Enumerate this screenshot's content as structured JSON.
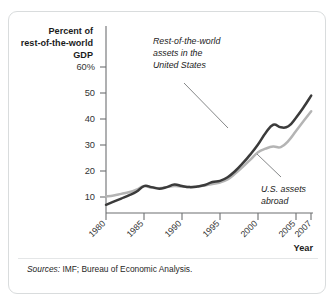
{
  "figure": {
    "y_axis_title": "Percent of\nrest-of-the-world\nGDP",
    "y_axis_title_lines": [
      "Percent of",
      "rest-of-the-world",
      "GDP"
    ],
    "x_axis_title": "Year",
    "source_label": "Sources:",
    "source_text": "IMF; Bureau of Economic Analysis.",
    "annotation_1_lines": [
      "Rest-of-the-world",
      "assets in the",
      "United States"
    ],
    "annotation_2_lines": [
      "U.S. assets",
      "abroad"
    ],
    "colors": {
      "series_dark": "#3b3b3b",
      "series_light": "#b4b4b4",
      "axis": "#6d6f71",
      "text": "#1b1b1b",
      "border": "#d9dcdd"
    }
  },
  "chart_data": {
    "type": "line",
    "title": "",
    "subtitle": "",
    "xlabel": "Year",
    "ylabel": "Percent of rest-of-the-world GDP",
    "xlim": [
      1980,
      2007
    ],
    "ylim": [
      0,
      65
    ],
    "grid": false,
    "legend_position": "annotations-on-plot",
    "ytick_labels": [
      "60%",
      "50",
      "40",
      "30",
      "20",
      "10"
    ],
    "ytick_values": [
      60,
      50,
      40,
      30,
      20,
      10
    ],
    "xtick_labels": [
      "1980",
      "1985",
      "1990",
      "1995",
      "2000",
      "2005",
      "2007"
    ],
    "xtick_values": [
      1980,
      1985,
      1990,
      1995,
      2000,
      2005,
      2007
    ],
    "x": [
      1980,
      1981,
      1982,
      1983,
      1984,
      1985,
      1986,
      1987,
      1988,
      1989,
      1990,
      1991,
      1992,
      1993,
      1994,
      1995,
      1996,
      1997,
      1998,
      1999,
      2000,
      2001,
      2002,
      2003,
      2004,
      2005,
      2006,
      2007
    ],
    "series": [
      {
        "name": "Rest-of-the-world assets in the United States",
        "color": "#3b3b3b",
        "values": [
          7.0,
          8.2,
          9.4,
          10.6,
          12.0,
          14.2,
          13.8,
          13.2,
          13.8,
          14.8,
          14.2,
          13.8,
          14.0,
          14.6,
          15.8,
          16.2,
          17.6,
          20.0,
          23.0,
          26.4,
          30.2,
          34.6,
          37.8,
          36.8,
          37.2,
          40.5,
          44.5,
          49.0
        ]
      },
      {
        "name": "U.S. assets abroad",
        "color": "#b4b4b4",
        "values": [
          10.2,
          10.6,
          11.2,
          11.8,
          12.8,
          14.2,
          13.6,
          13.4,
          13.8,
          14.2,
          14.0,
          13.8,
          14.0,
          14.4,
          15.0,
          15.6,
          16.8,
          19.0,
          21.6,
          24.4,
          27.2,
          28.6,
          29.4,
          29.2,
          31.6,
          35.4,
          39.2,
          43.0
        ]
      }
    ],
    "annotations": [
      {
        "text": "Rest-of-the-world assets in the United States",
        "points_to_series": "Rest-of-the-world assets in the United States",
        "points_to_x": 1997
      },
      {
        "text": "U.S. assets abroad",
        "points_to_series": "U.S. assets abroad",
        "points_to_x": 2001
      }
    ]
  }
}
